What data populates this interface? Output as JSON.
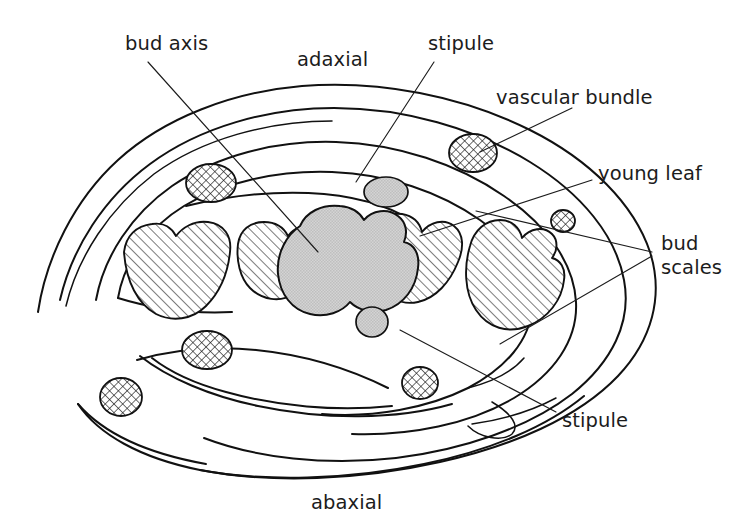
{
  "figure": {
    "background_color": "#ffffff",
    "line_color": "#111111",
    "text_color": "#1c1c1c",
    "gray_fill": "#cdcdcd",
    "hatch_fill": "#ffffff",
    "width": 744,
    "height": 532
  },
  "labels": {
    "bud_axis": "bud axis",
    "adaxial": "adaxial",
    "stipule_top": "stipule",
    "vascular_bundle": "vascular bundle",
    "young_leaf": "young leaf",
    "bud_scales_line1": "bud",
    "bud_scales_line2": "scales",
    "stipule_bottom": "stipule",
    "abaxial": "abaxial"
  },
  "structures": {
    "bud_axis": {
      "name": "bud axis",
      "fill": "gray",
      "count": 1
    },
    "young_leaves": {
      "name": "young leaf",
      "fill": "diagonal-hatch",
      "count": 4
    },
    "vascular_bundles": {
      "name": "vascular bundle",
      "fill": "cross-hatch",
      "count": 6
    },
    "stipules": {
      "name": "stipule",
      "fill": "gray",
      "count": 2
    },
    "bud_scales": {
      "name": "bud scales",
      "fill": "none",
      "count": 4
    }
  },
  "orientation": {
    "top": "adaxial",
    "bottom": "abaxial"
  }
}
